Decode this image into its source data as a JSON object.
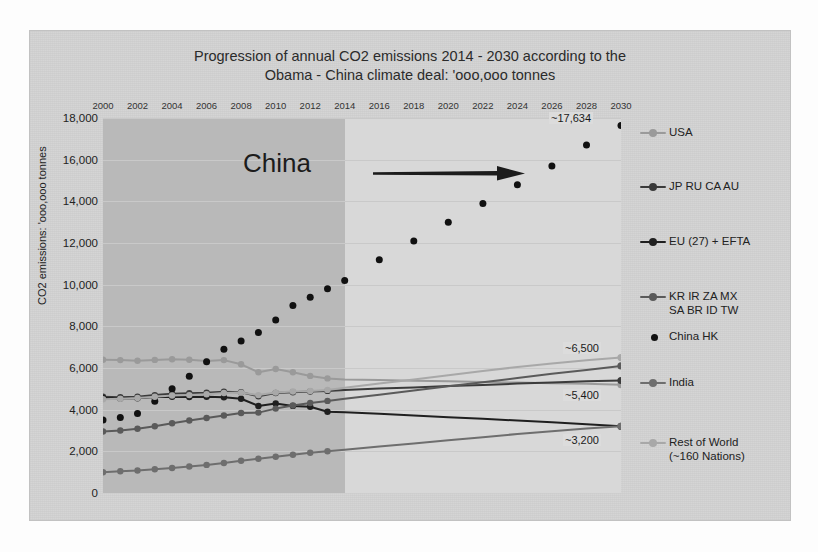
{
  "chart_data": {
    "type": "line",
    "title": "Progression of annual CO2 emissions 2014 - 2030 according to the Obama - China climate deal:  'ooo,ooo tonnes",
    "title_line1": "Progression of annual CO2 emissions 2014 - 2030 according to the",
    "title_line2": "Obama - China climate deal:  'ooo,ooo tonnes",
    "xlabel": "",
    "ylabel": "CO2 emissions:  'ooo,ooo tonnes",
    "xlim": [
      2000,
      2030
    ],
    "ylim": [
      0,
      18000
    ],
    "ytick_step": 2000,
    "grid": true,
    "legend_position": "right",
    "x_axis_labels_position": "top",
    "historical_range": [
      2000,
      2013
    ],
    "projection_range": [
      2013,
      2030
    ],
    "xticks": [
      2000,
      2002,
      2004,
      2006,
      2008,
      2010,
      2012,
      2014,
      2016,
      2018,
      2020,
      2022,
      2024,
      2026,
      2028,
      2030
    ],
    "yticks": [
      "0",
      "2,000",
      "4,000",
      "6,000",
      "8,000",
      "10,000",
      "12,000",
      "14,000",
      "16,000",
      "18,000"
    ],
    "x": [
      2000,
      2001,
      2002,
      2003,
      2004,
      2005,
      2006,
      2007,
      2008,
      2009,
      2010,
      2011,
      2012,
      2013,
      2014,
      2016,
      2018,
      2020,
      2022,
      2024,
      2026,
      2028,
      2030
    ],
    "series": [
      {
        "name": "USA",
        "color": "#9a9a9a",
        "marker": "circle",
        "values": [
          6400,
          6380,
          6350,
          6390,
          6420,
          6400,
          6330,
          6380,
          6180,
          5800,
          5950,
          5800,
          5620,
          5500,
          5450,
          5420,
          5390,
          5360,
          5330,
          5300,
          5270,
          5240,
          5200
        ],
        "endpoint_label": ""
      },
      {
        "name": "JP RU CA AU",
        "color": "#3b3b3b",
        "marker": "circle",
        "values": [
          4620,
          4600,
          4620,
          4700,
          4760,
          4790,
          4810,
          4860,
          4840,
          4640,
          4800,
          4840,
          4870,
          4900,
          4950,
          5010,
          5070,
          5130,
          5190,
          5250,
          5310,
          5360,
          5400
        ],
        "endpoint_label": "~5,400"
      },
      {
        "name": "EU (27) + EFTA",
        "color": "#1f1f1f",
        "marker": "circle",
        "values": [
          4560,
          4540,
          4550,
          4610,
          4620,
          4610,
          4620,
          4600,
          4520,
          4180,
          4300,
          4180,
          4140,
          3900,
          3880,
          3800,
          3720,
          3640,
          3560,
          3480,
          3400,
          3300,
          3200
        ],
        "endpoint_label": "~3,200"
      },
      {
        "name": "KR IR ZA MX SA BR ID TW",
        "color": "#5a5a5a",
        "marker": "circle",
        "values": [
          2950,
          3000,
          3080,
          3200,
          3350,
          3480,
          3600,
          3720,
          3840,
          3860,
          4050,
          4200,
          4320,
          4420,
          4520,
          4720,
          4920,
          5120,
          5320,
          5520,
          5720,
          5900,
          6100
        ],
        "endpoint_label": ""
      },
      {
        "name": "China HK",
        "color": "#111111",
        "marker": "dot-only",
        "values": [
          3500,
          3620,
          3820,
          4400,
          5000,
          5600,
          6300,
          6900,
          7300,
          7700,
          8300,
          9000,
          9400,
          9800,
          10200,
          11200,
          12100,
          13000,
          13900,
          14800,
          15700,
          16700,
          17634
        ],
        "endpoint_label": "~17,634"
      },
      {
        "name": "India",
        "color": "#6e6e6e",
        "marker": "circle",
        "values": [
          1000,
          1040,
          1080,
          1140,
          1200,
          1270,
          1350,
          1440,
          1550,
          1640,
          1740,
          1840,
          1930,
          2000,
          2080,
          2230,
          2380,
          2530,
          2680,
          2830,
          2960,
          3090,
          3200
        ],
        "endpoint_label": ""
      },
      {
        "name": "Rest of World (~160 Nations)",
        "color": "#a8a8a8",
        "marker": "circle",
        "values": [
          4500,
          4520,
          4560,
          4620,
          4680,
          4700,
          4740,
          4800,
          4820,
          4700,
          4820,
          4870,
          4900,
          4950,
          5050,
          5250,
          5450,
          5650,
          5850,
          6050,
          6220,
          6370,
          6500
        ],
        "endpoint_label": "~6,500"
      }
    ],
    "annotations": [
      {
        "text": "China",
        "kind": "text-label"
      },
      {
        "text": "",
        "kind": "arrow-right"
      }
    ],
    "data_labels": [
      {
        "text": "~17,634",
        "series": "China HK",
        "year": 2030
      },
      {
        "text": "~6,500",
        "series": "Rest of World (~160 Nations)",
        "year": 2030
      },
      {
        "text": "~5,400",
        "series": "JP RU CA AU",
        "year": 2030
      },
      {
        "text": "~3,200",
        "series": "EU (27) + EFTA",
        "year": 2030
      }
    ]
  },
  "legend": {
    "items": [
      {
        "label": "USA",
        "color": "#9a9a9a",
        "style": "line-marker"
      },
      {
        "label": "JP RU CA AU",
        "color": "#3b3b3b",
        "style": "line-marker"
      },
      {
        "label": "EU (27) + EFTA",
        "color": "#1f1f1f",
        "style": "line-marker"
      },
      {
        "label": "KR IR ZA MX\nSA BR ID TW",
        "color": "#5a5a5a",
        "style": "line-marker"
      },
      {
        "label": "China HK",
        "color": "#111111",
        "style": "marker-only"
      },
      {
        "label": "India",
        "color": "#6e6e6e",
        "style": "line-marker"
      },
      {
        "label": "Rest of World\n(~160 Nations)",
        "color": "#a8a8a8",
        "style": "line-marker"
      }
    ]
  },
  "colors": {
    "panel_background": "#d3d3d3",
    "plot_historical": "#b9b9b9",
    "plot_projection": "#d8d8d8",
    "gridline": "#c9c9c9",
    "text": "#222222"
  }
}
